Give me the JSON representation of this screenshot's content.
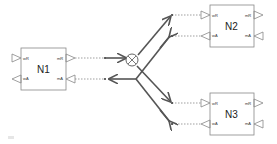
{
  "diagram": {
    "nodes": [
      {
        "id": "N1",
        "label": "N1",
        "ports": {
          "wR": "wR",
          "wA": "wA",
          "mR": "mR",
          "mA": "mA"
        }
      },
      {
        "id": "N2",
        "label": "N2",
        "ports": {
          "wR": "wR",
          "wA": "wA",
          "mR": "mR",
          "mA": "mA"
        }
      },
      {
        "id": "N3",
        "label": "N3",
        "ports": {
          "wR": "wR",
          "wA": "wA",
          "mR": "mR",
          "mA": "mA"
        }
      }
    ],
    "junction": {
      "symbol": "⊗",
      "description": "fork/join junction"
    },
    "edges": [
      {
        "from": "N1.mR",
        "to": "junction",
        "style": "dashed"
      },
      {
        "from": "junction",
        "to": "N1.mA",
        "style": "dashed"
      },
      {
        "from": "junction",
        "to": "N2.wR",
        "style": "dashed"
      },
      {
        "from": "N2.wA",
        "to": "junction",
        "style": "dashed"
      },
      {
        "from": "junction",
        "to": "N3.wR",
        "style": "dashed"
      },
      {
        "from": "N3.wA",
        "to": "junction",
        "style": "dashed"
      }
    ],
    "colors": {
      "line": "#555555",
      "box": "#888888",
      "dash": "#777777"
    }
  }
}
